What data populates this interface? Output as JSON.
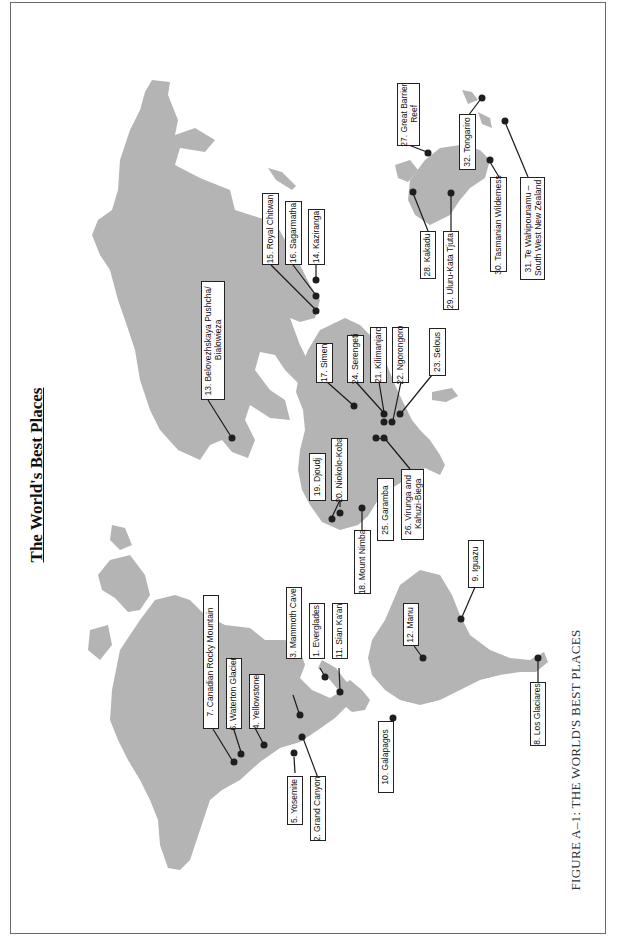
{
  "page": {
    "title": "The World's Best Places",
    "caption": "FIGURE A–1: THE WORLD'S BEST PLACES",
    "orientation": "rotated-90-ccw",
    "land_color": "#b4b4b4",
    "marker_color": "#1e1e1e"
  },
  "places": [
    {
      "n": 1,
      "text": "1. Everglades"
    },
    {
      "n": 2,
      "text": "2. Grand Canyon"
    },
    {
      "n": 3,
      "text": "3. Mammoth Cave"
    },
    {
      "n": 4,
      "text": "4. Yellowstone"
    },
    {
      "n": 5,
      "text": "5. Yosemite"
    },
    {
      "n": 6,
      "text": "6. Waterton Glacier"
    },
    {
      "n": 7,
      "text": "7. Canadian Rocky Mountain"
    },
    {
      "n": 8,
      "text": "8. Los Glaciares"
    },
    {
      "n": 9,
      "text": "9. Iguazu"
    },
    {
      "n": 10,
      "text": "10. Galapagos"
    },
    {
      "n": 11,
      "text": "11. Sian Ka'an"
    },
    {
      "n": 12,
      "text": "12. Manu"
    },
    {
      "n": 13,
      "text": "13. Belovezhskaya Pushcha/\n Bialowieza"
    },
    {
      "n": 14,
      "text": "14. Kaziranga"
    },
    {
      "n": 15,
      "text": "15. Royal Chitwan"
    },
    {
      "n": 16,
      "text": "16. Sagarmatha"
    },
    {
      "n": 17,
      "text": "17. Simen"
    },
    {
      "n": 18,
      "text": "18. Mount Nimba"
    },
    {
      "n": 19,
      "text": "19. Djoudj"
    },
    {
      "n": 20,
      "text": "20. Niokolo-Koba"
    },
    {
      "n": 21,
      "text": "21. Kilimanjaro"
    },
    {
      "n": 22,
      "text": "22. Ngorongoro"
    },
    {
      "n": 23,
      "text": "23. Selous"
    },
    {
      "n": 24,
      "text": "24. Serengeti"
    },
    {
      "n": 25,
      "text": "25. Garamba"
    },
    {
      "n": 26,
      "text": "26. Virunga and\n Kahuzi-Biega"
    },
    {
      "n": 27,
      "text": "27. Great Barrier\n Reef"
    },
    {
      "n": 28,
      "text": "28. Kakadu"
    },
    {
      "n": 29,
      "text": "29. Uluru-Kata Tjuta"
    },
    {
      "n": 30,
      "text": "30. Tasmanian Wilderness"
    },
    {
      "n": 31,
      "text": "31. Te Wahipounamu –\n South West New Zealand"
    },
    {
      "n": 32,
      "text": "32. Tongariro"
    }
  ]
}
